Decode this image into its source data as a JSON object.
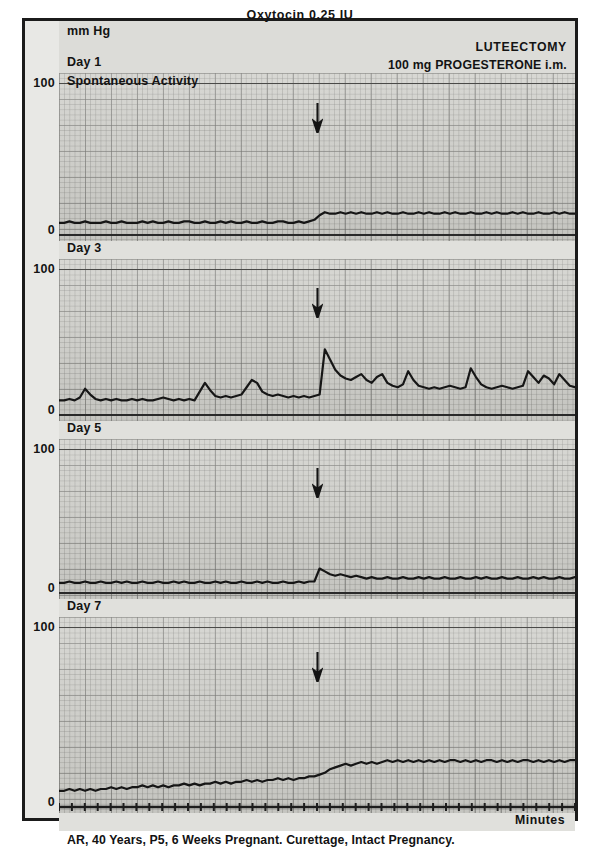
{
  "figure": {
    "units_label": "mm Hg",
    "x_axis_label": "Minutes",
    "caption": "AR, 40 Years, P5, 6 Weeks Pregnant. Curettage, Intact Pregnancy.",
    "stimulus_label": "Oxytocin 0.25 IU",
    "treatment_title": "LUTEECTOMY",
    "treatment_dose": "100 mg PROGESTERONE i.m.",
    "treatment_frequency": "Twice a Day",
    "arrow_icon": "down-arrow-marker",
    "ink_color": "#161616",
    "paper_color": "#d2d2ce",
    "grid_color": "#5f5f5c"
  },
  "chart_data": {
    "type": "line",
    "title": "Oxytocin 0.25 IU",
    "subtitle": "LUTEECTOMY — 100 mg PROGESTERONE i.m. Twice a Day",
    "xlabel": "Minutes",
    "ylabel": "mm Hg",
    "ylim": [
      0,
      100
    ],
    "yticks": [
      0,
      100
    ],
    "grid": true,
    "legend_position": "none",
    "annotations": [
      {
        "text": "Oxytocin 0.25 IU",
        "x_fraction": 0.5,
        "type": "stimulus-label"
      },
      {
        "text": "arrow marks oxytocin injection",
        "x_fraction": 0.5,
        "type": "arrow"
      }
    ],
    "panels": [
      {
        "name": "Day 1",
        "day": 1,
        "extra_label": "Spontaneous Activity",
        "ylim": [
          0,
          100
        ],
        "ytick_top": "100",
        "ytick_bottom": "0",
        "arrow_x_fraction": 0.5,
        "description": "Low flat baseline tone ~8 mm Hg with small irregular waves; after oxytocin a modest rise to ~14 mm Hg with slightly increased small-amplitude activity sustained to the end of the trace.",
        "baseline_mmhg": 8,
        "peak_mmhg": 16,
        "values": [
          8,
          8,
          9,
          8,
          8,
          9,
          8,
          8,
          8,
          9,
          8,
          8,
          9,
          8,
          8,
          8,
          9,
          8,
          9,
          8,
          8,
          9,
          8,
          8,
          9,
          9,
          8,
          8,
          9,
          8,
          8,
          9,
          8,
          9,
          8,
          8,
          9,
          8,
          8,
          9,
          8,
          8,
          9,
          9,
          8,
          8,
          9,
          8,
          9,
          10,
          13,
          15,
          14,
          14,
          15,
          14,
          15,
          14,
          15,
          14,
          14,
          15,
          14,
          15,
          14,
          14,
          15,
          14,
          14,
          15,
          14,
          15,
          14,
          14,
          15,
          14,
          15,
          14,
          14,
          15,
          14,
          14,
          15,
          14,
          15,
          14,
          14,
          15,
          14,
          15,
          14,
          14,
          15,
          14,
          14,
          15,
          14,
          15,
          14,
          14
        ]
      },
      {
        "name": "Day 3",
        "day": 3,
        "extra_label": "",
        "ylim": [
          0,
          100
        ],
        "ytick_top": "100",
        "ytick_bottom": "0",
        "arrow_x_fraction": 0.5,
        "description": "Baseline ~10 mm Hg with occasional small contractions; a sharp oxytocin-induced contraction reaching ~45 mm Hg at the arrow, followed by recurrent contractions of 22-32 mm Hg throughout the remainder of the trace.",
        "baseline_mmhg": 10,
        "peak_mmhg": 45,
        "values": [
          10,
          10,
          11,
          10,
          12,
          18,
          14,
          11,
          10,
          11,
          10,
          11,
          10,
          10,
          11,
          10,
          11,
          10,
          10,
          11,
          12,
          11,
          10,
          11,
          10,
          11,
          10,
          16,
          22,
          17,
          13,
          12,
          13,
          12,
          13,
          14,
          19,
          24,
          22,
          16,
          14,
          13,
          14,
          13,
          12,
          13,
          12,
          13,
          12,
          13,
          14,
          45,
          38,
          31,
          27,
          25,
          24,
          26,
          28,
          24,
          22,
          26,
          28,
          22,
          20,
          19,
          21,
          30,
          24,
          20,
          19,
          18,
          19,
          18,
          19,
          20,
          19,
          18,
          19,
          32,
          26,
          21,
          19,
          18,
          19,
          20,
          19,
          18,
          19,
          20,
          30,
          26,
          22,
          27,
          25,
          21,
          28,
          24,
          20,
          19
        ]
      },
      {
        "name": "Day 5",
        "day": 5,
        "extra_label": "",
        "ylim": [
          0,
          100
        ],
        "ytick_top": "100",
        "ytick_bottom": "0",
        "arrow_x_fraction": 0.5,
        "description": "Essentially quiescent trace at ~7 mm Hg with minimal oscillation; a single small transient rise to ~17 mm Hg just after oxytocin, returning quickly to the flat baseline.",
        "baseline_mmhg": 7,
        "peak_mmhg": 17,
        "values": [
          7,
          7,
          8,
          7,
          7,
          8,
          7,
          7,
          8,
          7,
          7,
          8,
          7,
          8,
          7,
          7,
          8,
          7,
          7,
          8,
          7,
          7,
          8,
          7,
          8,
          7,
          7,
          8,
          7,
          7,
          8,
          7,
          8,
          7,
          7,
          8,
          7,
          7,
          8,
          7,
          8,
          7,
          7,
          8,
          7,
          7,
          8,
          7,
          8,
          8,
          17,
          15,
          13,
          12,
          13,
          12,
          11,
          12,
          11,
          10,
          11,
          10,
          10,
          11,
          10,
          10,
          11,
          10,
          10,
          11,
          10,
          11,
          10,
          10,
          11,
          10,
          10,
          11,
          10,
          10,
          11,
          10,
          11,
          10,
          10,
          11,
          10,
          10,
          11,
          10,
          10,
          11,
          10,
          11,
          10,
          10,
          11,
          10,
          10,
          11
        ]
      },
      {
        "name": "Day 7",
        "day": 7,
        "extra_label": "",
        "ylim": [
          0,
          100
        ],
        "ytick_top": "100",
        "ytick_bottom": "0",
        "arrow_x_fraction": 0.5,
        "description": "Baseline tone ~9 mm Hg rising progressively through the record; after oxytocin the tone climbs to a sustained plateau of ~22-26 mm Hg with continuous low-amplitude activity to the end.",
        "baseline_mmhg": 9,
        "peak_mmhg": 27,
        "values": [
          9,
          9,
          10,
          9,
          10,
          9,
          10,
          9,
          10,
          10,
          11,
          10,
          11,
          10,
          11,
          11,
          12,
          11,
          12,
          11,
          12,
          11,
          12,
          12,
          13,
          12,
          13,
          12,
          13,
          13,
          14,
          13,
          14,
          13,
          14,
          14,
          15,
          14,
          15,
          14,
          15,
          15,
          16,
          15,
          16,
          15,
          16,
          16,
          17,
          17,
          18,
          19,
          21,
          22,
          23,
          24,
          23,
          24,
          25,
          24,
          25,
          24,
          25,
          26,
          25,
          26,
          25,
          26,
          25,
          26,
          25,
          26,
          25,
          26,
          25,
          26,
          26,
          25,
          26,
          25,
          26,
          25,
          26,
          26,
          25,
          26,
          25,
          26,
          25,
          26,
          26,
          25,
          26,
          25,
          26,
          25,
          26,
          25,
          26,
          26
        ]
      }
    ]
  }
}
